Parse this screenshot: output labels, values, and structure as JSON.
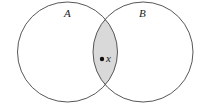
{
  "diagram": {
    "type": "venn",
    "sets": [
      {
        "label": "A",
        "cx": 67.5,
        "cy": 52,
        "r": 50
      },
      {
        "label": "B",
        "cx": 143,
        "cy": 52,
        "r": 50
      }
    ],
    "intersection_fill": "#d9d9d9",
    "stroke": "#444444",
    "point": {
      "label": "x",
      "cx": 102,
      "cy": 59,
      "r": 2.2
    }
  }
}
